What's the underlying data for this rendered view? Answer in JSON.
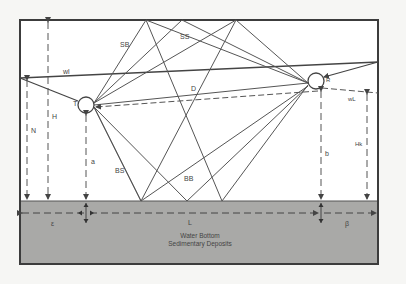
{
  "diagram": {
    "colors": {
      "background": "#f6f6f4",
      "water": "#ffffff",
      "sediment": "#a9a9a7",
      "frame": "#3c3c3c",
      "ray": "#555555",
      "dash": "#555555"
    },
    "nodes": {
      "transmitter": {
        "label": "T"
      },
      "receiver": {
        "label": "R"
      }
    },
    "ray_labels": {
      "surface_bottom": "SB",
      "surface_surface": "SS",
      "direct": "D",
      "bottom_surface": "BS",
      "bottom_bottom": "BB"
    },
    "surface_labels": {
      "water_surface_left": "wl",
      "water_surface_right": "wL"
    },
    "dimension_labels": {
      "total_depth": "H",
      "left_depth": "N",
      "transmitter_height": "a",
      "receiver_height": "b",
      "right_depth": "Hk",
      "range": "L",
      "left_offset": "ε",
      "right_offset": "β"
    },
    "bottom_labels": {
      "line1": "Water Bottom",
      "line2": "Sedimentary Deposits"
    }
  }
}
